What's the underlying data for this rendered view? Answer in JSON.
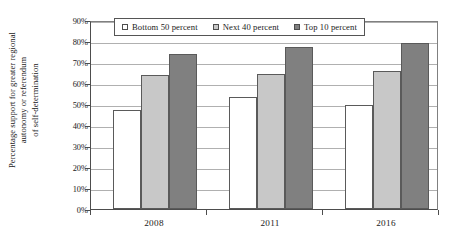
{
  "chart_data": {
    "type": "bar",
    "title": "",
    "subtitle": "",
    "xlabel": "",
    "ylabel": "Percentage support for greater regional autonomy or referendum of self-determination",
    "ylabel_lines": [
      "Percentage support for greater regional",
      "autonomy or referendum",
      "of self-determination"
    ],
    "categories": [
      "2008",
      "2011",
      "2016"
    ],
    "series": [
      {
        "name": "Bottom 50 percent",
        "values": [
          47,
          53.5,
          49.5
        ],
        "color": "#ffffff",
        "border": "#5a5a5a"
      },
      {
        "name": "Next 40 percent",
        "values": [
          64,
          64.5,
          65.5
        ],
        "color": "#c8c8c8",
        "border": "#5a5a5a"
      },
      {
        "name": "Top 10 percent",
        "values": [
          74,
          77,
          79
        ],
        "color": "#808080",
        "border": "#5a5a5a"
      }
    ],
    "ylim": [
      0,
      90
    ],
    "ytick_values": [
      0,
      10,
      20,
      30,
      40,
      50,
      60,
      70,
      80,
      90
    ],
    "ytick_labels": [
      "0%",
      "10%",
      "20%",
      "30%",
      "40%",
      "50%",
      "60%",
      "70%",
      "80%",
      "90%"
    ],
    "grid": true,
    "grid_axis": "y",
    "legend_position": "top-center-inside",
    "legend_entries": [
      "Bottom 50 percent",
      "Next 40 percent",
      "Top 10 percent"
    ],
    "annotations": []
  },
  "axis": {
    "y_tick_labels": [
      "90%",
      "80%",
      "70%",
      "60%",
      "50%",
      "40%",
      "30%",
      "20%",
      "10%",
      "0%"
    ],
    "x_tick_labels": [
      "2008",
      "2011",
      "2016"
    ]
  },
  "legend": {
    "items": [
      {
        "label": "Bottom 50 percent",
        "swatch": "#ffffff"
      },
      {
        "label": "Next 40 percent",
        "swatch": "#c8c8c8"
      },
      {
        "label": "Top 10 percent",
        "swatch": "#808080"
      }
    ]
  },
  "colors": {
    "bottom_50": "#ffffff",
    "next_40": "#c8c8c8",
    "top_10": "#808080",
    "bar_border": "#5a5a5a",
    "gridline": "#b0b0b0",
    "axis": "#4d4d4d",
    "text": "#1a1a1a",
    "background": "#ffffff"
  }
}
